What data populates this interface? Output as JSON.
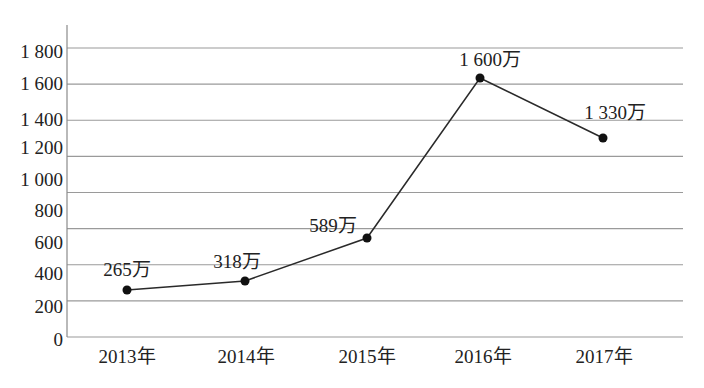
{
  "chart_data": {
    "type": "line",
    "title": "",
    "xlabel": "",
    "ylabel": "",
    "categories": [
      "2013年",
      "2014年",
      "2015年",
      "2016年",
      "2017年"
    ],
    "series": [
      {
        "name": "",
        "values": [
          265,
          318,
          589,
          1600,
          1330
        ],
        "data_labels": [
          "265万",
          "318万",
          "589万",
          "1 600万",
          "1 330万"
        ]
      }
    ],
    "yticks": [
      0,
      200,
      400,
      600,
      800,
      1000,
      1200,
      1400,
      1600,
      1800
    ],
    "ytick_labels": [
      "0",
      "200",
      "400",
      "600",
      "800",
      "1 000",
      "1 200",
      "1 400",
      "1 600",
      "1 800"
    ],
    "ylim": [
      0,
      1800
    ],
    "grid": true,
    "legend": null,
    "colors": {
      "line": "#2a2a2a",
      "marker": "#111111",
      "grid": "#9a9a9a",
      "text": "#222222"
    }
  }
}
